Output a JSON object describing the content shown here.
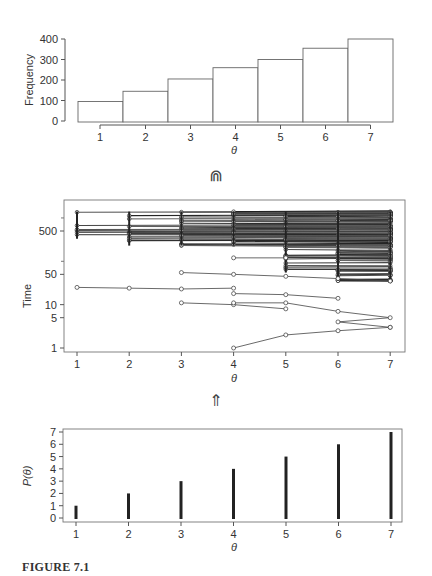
{
  "figure": {
    "caption": "FIGURE 7.1",
    "arrow_top": "⋒",
    "arrow_bottom": "⇑"
  },
  "chart_data": [
    {
      "type": "bar",
      "title": "",
      "xlabel": "θ",
      "ylabel": "Frequency",
      "categories": [
        "1",
        "2",
        "3",
        "4",
        "5",
        "6",
        "7"
      ],
      "values": [
        95,
        145,
        205,
        260,
        300,
        355,
        400
      ],
      "yticks": [
        "0",
        "100",
        "200",
        "300",
        "400"
      ],
      "ylim": [
        0,
        400
      ],
      "grid": false,
      "note": "histogram of sampled theta values"
    },
    {
      "type": "line",
      "title": "",
      "xlabel": "θ",
      "ylabel": "Time",
      "x": [
        1,
        2,
        3,
        4,
        5,
        6,
        7
      ],
      "yscale": "log",
      "yticks": [
        "1",
        "5",
        "10",
        "50",
        "500"
      ],
      "ylim": [
        1,
        2000
      ],
      "grid": false,
      "series": [
        {
          "name": "trace-a",
          "x": [
            1,
            2,
            3,
            4
          ],
          "values": [
            25,
            24,
            23,
            24
          ]
        },
        {
          "name": "trace-b",
          "x": [
            3,
            4,
            5
          ],
          "values": [
            11,
            10,
            8
          ]
        },
        {
          "name": "trace-c",
          "x": [
            4,
            5,
            6,
            7,
            6,
            7
          ],
          "values": [
            11,
            11,
            7,
            5,
            4,
            3
          ]
        },
        {
          "name": "trace-d",
          "x": [
            4,
            5,
            6,
            7
          ],
          "values": [
            1,
            2,
            2.5,
            3
          ]
        },
        {
          "name": "trace-e",
          "x": [
            4,
            5,
            6
          ],
          "values": [
            18,
            17,
            14
          ]
        },
        {
          "name": "trace-f",
          "x": [
            3,
            4,
            5,
            6,
            7
          ],
          "values": [
            55,
            50,
            45,
            40,
            35
          ]
        },
        {
          "name": "trace-g",
          "x": [
            4,
            5
          ],
          "values": [
            120,
            120
          ]
        },
        {
          "name": "dense-band",
          "x": [
            1,
            2,
            3,
            4,
            5,
            6,
            7
          ],
          "values": [
            1200,
            1100,
            1000,
            900,
            800,
            700,
            600
          ]
        }
      ],
      "note": "many overlapping trajectories, dense band between ~40 and ~1500"
    },
    {
      "type": "bar",
      "title": "",
      "xlabel": "θ",
      "ylabel": "P(θ)",
      "categories": [
        "1",
        "2",
        "3",
        "4",
        "5",
        "6",
        "7"
      ],
      "values": [
        1,
        2,
        3,
        4,
        5,
        6,
        7
      ],
      "yticks": [
        "0",
        "1",
        "2",
        "3",
        "4",
        "5",
        "6",
        "7"
      ],
      "ylim": [
        0,
        7
      ],
      "grid": false,
      "note": "spike plot (thin vertical bars)"
    }
  ]
}
